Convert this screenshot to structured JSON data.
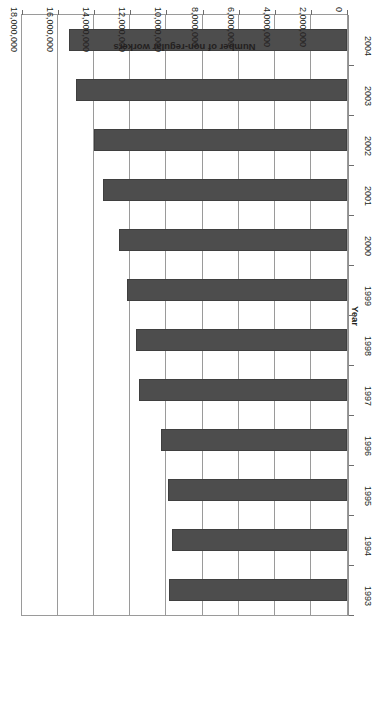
{
  "chart_data": {
    "type": "bar",
    "orientation": "horizontal",
    "title": "",
    "subtitle": "",
    "xlabel": "Number of non-regular workers",
    "ylabel": "Year",
    "categories": [
      "1993",
      "1994",
      "1995",
      "1996",
      "1997",
      "1998",
      "1999",
      "2000",
      "2001",
      "2002",
      "2003",
      "2004"
    ],
    "values": [
      9850000,
      9700000,
      9900000,
      10300000,
      11500000,
      11700000,
      12200000,
      12600000,
      13500000,
      14000000,
      15000000,
      15400000
    ],
    "series": [
      {
        "name": "Number of non-regular workers",
        "values": [
          9850000,
          9700000,
          9900000,
          10300000,
          11500000,
          11700000,
          12200000,
          12600000,
          13500000,
          14000000,
          15000000,
          15400000
        ]
      }
    ],
    "value_axis_ticks": [
      0,
      2000000,
      4000000,
      6000000,
      8000000,
      10000000,
      12000000,
      14000000,
      16000000,
      18000000
    ],
    "value_axis_tick_labels": [
      "0",
      "2,000,000",
      "4,000,000",
      "6,000,000",
      "8,000,000",
      "10,000,000",
      "12,000,000",
      "14,000,000",
      "16,000,000",
      "18,000,000"
    ],
    "xlim": [
      0,
      18000000
    ],
    "grid": true,
    "grid_axis": "value",
    "legend": false,
    "legend_position": "none",
    "bar_color": "#4d4d4d",
    "bar_edge_color": "#3f3f3f",
    "plot_background": "#ffffff",
    "axis_color": "#9a9a9a",
    "rotated_180": true,
    "annotations": []
  }
}
